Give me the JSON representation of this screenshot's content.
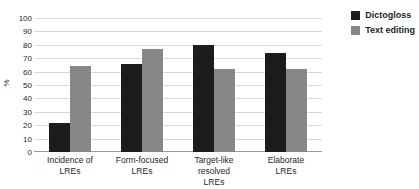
{
  "chart_data": {
    "type": "bar",
    "title": "",
    "xlabel": "",
    "ylabel": "%",
    "ylim": [
      0,
      100
    ],
    "ytick_step": 10,
    "yticks": [
      100,
      90,
      80,
      70,
      60,
      50,
      40,
      30,
      20,
      10,
      0
    ],
    "grid": true,
    "legend_position": "top-right",
    "categories": [
      "Incidence of LREs",
      "Form-focused LREs",
      "Target-like resolved LREs",
      "Elaborate LREs"
    ],
    "category_lines": [
      [
        "Incidence of",
        "LREs"
      ],
      [
        "Form-focused",
        "LREs"
      ],
      [
        "Target-like resolved",
        "LREs"
      ],
      [
        "Elaborate",
        "LREs"
      ]
    ],
    "series": [
      {
        "name": "Dictogloss",
        "color": "#1c1c1c",
        "values": [
          22,
          66,
          80,
          74
        ]
      },
      {
        "name": "Text editing",
        "color": "#878787",
        "values": [
          64,
          77,
          62,
          62
        ]
      }
    ]
  }
}
